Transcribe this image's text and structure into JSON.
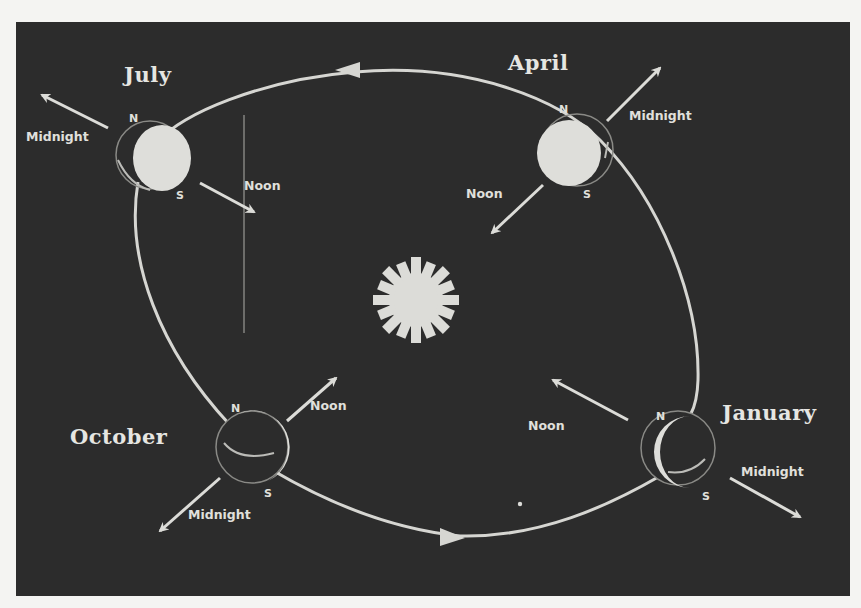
{
  "diagram": {
    "colors": {
      "background": "#f4f4f2",
      "panel": "#2c2c2c",
      "foreground": "#e2e2de"
    },
    "sun": {
      "label": "",
      "icon": "sun-icon"
    },
    "orbit": {
      "direction": "counterclockwise",
      "arrow_top": "left",
      "arrow_bottom": "right"
    },
    "positions": [
      {
        "month": "July",
        "north": "N",
        "south": "S",
        "noon": "Noon",
        "midnight": "Midnight",
        "illumination": "full"
      },
      {
        "month": "April",
        "north": "N",
        "south": "S",
        "noon": "Noon",
        "midnight": "Midnight",
        "illumination": "full"
      },
      {
        "month": "October",
        "north": "N",
        "south": "S",
        "noon": "Noon",
        "midnight": "Midnight",
        "illumination": "crescent"
      },
      {
        "month": "January",
        "north": "N",
        "south": "S",
        "noon": "Noon",
        "midnight": "Midnight",
        "illumination": "crescent"
      }
    ],
    "center_noon_label": "Noon"
  }
}
